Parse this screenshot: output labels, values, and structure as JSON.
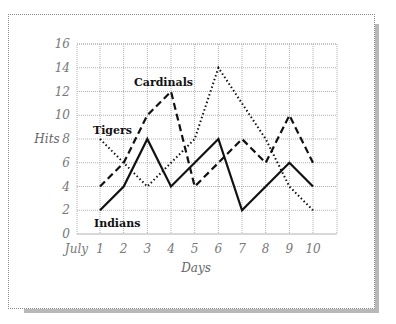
{
  "chart_data": {
    "type": "line",
    "title": "",
    "xlabel": "Days",
    "ylabel": "Hits",
    "x_prefix_label": "July",
    "x": [
      1,
      2,
      3,
      4,
      5,
      6,
      7,
      8,
      9,
      10
    ],
    "x_tick_labels": [
      "1",
      "2",
      "3",
      "4",
      "5",
      "6",
      "7",
      "8",
      "9",
      "10"
    ],
    "y_ticks": [
      0,
      2,
      4,
      6,
      8,
      10,
      12,
      14,
      16
    ],
    "y_tick_labels": [
      "0",
      "2",
      "4",
      "6",
      "8",
      "10",
      "12",
      "14",
      "16"
    ],
    "ylim": [
      0,
      16
    ],
    "xlim": [
      0,
      11
    ],
    "grid": true,
    "legend_position": "inline labels",
    "series": [
      {
        "name": "Indians",
        "style": "solid",
        "values": [
          2,
          4,
          8,
          4,
          6,
          8,
          2,
          4,
          6,
          4
        ]
      },
      {
        "name": "Cardinals",
        "style": "dashed",
        "values": [
          4,
          6,
          10,
          12,
          4,
          6,
          8,
          6,
          10,
          6
        ]
      },
      {
        "name": "Tigers",
        "style": "dotted",
        "values": [
          8,
          6,
          4,
          6,
          8,
          14,
          11,
          8,
          4,
          2
        ]
      }
    ],
    "annotations": [
      {
        "text": "Cardinals",
        "near_series": "Cardinals"
      },
      {
        "text": "Tigers",
        "near_series": "Tigers"
      },
      {
        "text": "Indians",
        "near_series": "Indians"
      }
    ]
  },
  "labels": {
    "y_axis": "Hits",
    "x_axis": "Days",
    "x_prefix": "July",
    "cardinals": "Cardinals",
    "tigers": "Tigers",
    "indians": "Indians"
  },
  "colors": {
    "line": "#111111",
    "grid": "#b0b0b0",
    "tick_text": "#777777",
    "shadow": "#b8b8b8"
  }
}
